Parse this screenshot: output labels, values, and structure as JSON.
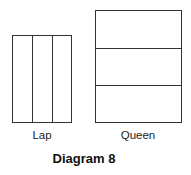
{
  "diagram": {
    "title": "Diagram 8",
    "shapes": [
      {
        "label": "Lap",
        "divisions": 3,
        "orientation": "vertical"
      },
      {
        "label": "Queen",
        "divisions": 3,
        "orientation": "horizontal"
      }
    ],
    "stroke_color": "#333333"
  }
}
